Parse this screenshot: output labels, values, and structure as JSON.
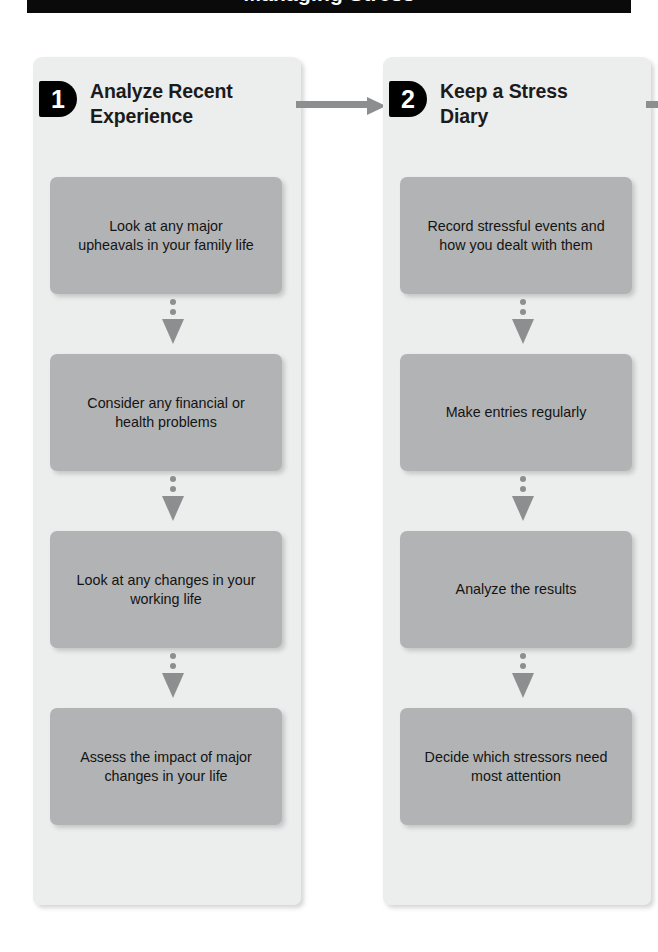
{
  "banner": {
    "title": "Managing Stress"
  },
  "diagram": {
    "type": "process-flow",
    "orientation": "horizontal-steps-with-vertical-substeps",
    "colors": {
      "panel_background": "#eceded",
      "task_box": "#b2b3b4",
      "connector": "#8d8e8f",
      "badge": "#000000",
      "banner": "#0a0a0a",
      "text": "#131313"
    },
    "steps": [
      {
        "number": "1",
        "title": "Analyze Recent\nExperience",
        "tasks": [
          "Look at any major\nupheavals in your family life",
          "Consider any financial or\nhealth problems",
          "Look at any changes in your\nworking life",
          "Assess the impact of major\nchanges in your life"
        ]
      },
      {
        "number": "2",
        "title": "Keep a Stress\nDiary",
        "tasks": [
          "Record stressful events and\nhow you dealt with them",
          "Make entries regularly",
          "Analyze the results",
          "Decide which stressors need\nmost attention"
        ]
      }
    ],
    "connectors": {
      "between_steps_label": "arrow-right",
      "between_tasks_label": "dotted-arrow-down"
    }
  }
}
